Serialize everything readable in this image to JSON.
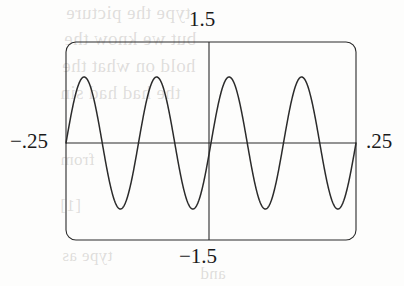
{
  "figure": {
    "name": "graphing-calculator-sine-plot",
    "background_color": "#fdfdfc",
    "ink_color": "#2b2b2b"
  },
  "axis_labels": {
    "top": "1.5",
    "bottom": "−1.5",
    "left": "−.25",
    "right": ".25"
  },
  "bleed_text": {
    "line1": "type  the  picture",
    "line2": "but we know the",
    "line3": "hold on what the",
    "line4": "the had had sin",
    "line5": "from",
    "line6": "[1]",
    "line7": "type as",
    "line8": "and"
  },
  "chart_data": {
    "type": "line",
    "title": "",
    "xlabel": "",
    "ylabel": "",
    "xlim": [
      -0.25,
      0.25
    ],
    "ylim": [
      -1.5,
      1.5
    ],
    "xticks": [
      -0.25,
      0.25
    ],
    "xticklabels": [
      "−.25",
      ".25"
    ],
    "yticks": [
      -1.5,
      1.5
    ],
    "yticklabels": [
      "−1.5",
      "1.5"
    ],
    "grid": false,
    "legend": null,
    "axes_style": "calculator-window-rounded-frame",
    "x_axis_y": 0,
    "y_axis_x": 0,
    "series": [
      {
        "name": "sine",
        "amplitude": 1.0,
        "cycles_in_window": 4,
        "period": 0.125,
        "phase": 0,
        "expression": "y = sin(16πx)",
        "x": [
          -0.25,
          -0.2344,
          -0.2188,
          -0.2031,
          -0.1875,
          -0.1719,
          -0.1563,
          -0.1406,
          -0.125,
          -0.1094,
          -0.0938,
          -0.0781,
          -0.0625,
          -0.0469,
          -0.0313,
          -0.0156,
          0,
          0.0156,
          0.0313,
          0.0469,
          0.0625,
          0.0781,
          0.0938,
          0.1094,
          0.125,
          0.1406,
          0.1563,
          0.1719,
          0.1875,
          0.2031,
          0.2188,
          0.2344,
          0.25
        ],
        "values": [
          0,
          0.707,
          1,
          0.707,
          0,
          -0.707,
          -1,
          -0.707,
          0,
          0.707,
          1,
          0.707,
          0,
          -0.707,
          -1,
          -0.707,
          0,
          0.707,
          1,
          0.707,
          0,
          -0.707,
          -1,
          -0.707,
          0,
          0.707,
          1,
          0.707,
          0,
          -0.707,
          -1,
          -0.707,
          0
        ]
      }
    ]
  },
  "geometry": {
    "frame_left": 66,
    "frame_top": 42,
    "frame_right": 356,
    "frame_bottom": 240,
    "corner_radius": 10,
    "axis_x": 209,
    "axis_y": 143,
    "amplitude_px": 66
  }
}
